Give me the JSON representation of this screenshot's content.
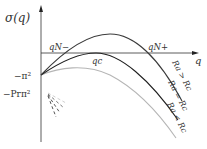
{
  "diagram": {
    "y_axis_label": "σ(q)",
    "x_axis_label": "q",
    "y_ticks": {
      "neg_pi_sq": "−π²",
      "neg_pr_pi_sq": "−Prπ²"
    },
    "points": {
      "qN_minus": "qN−",
      "qN_plus": "qN+",
      "qc": "qc"
    },
    "curves": [
      {
        "label": "Ra > Rc",
        "color": "#3a3a3a"
      },
      {
        "label": "Ra = Rc",
        "color": "#1e1e1e"
      },
      {
        "label": "Ra < Rc",
        "color": "#b0b0b0"
      }
    ],
    "curve_labels": {
      "above": "Ra > Rc",
      "equal": "Ra = Rc",
      "below": "Ra < Rc"
    }
  }
}
